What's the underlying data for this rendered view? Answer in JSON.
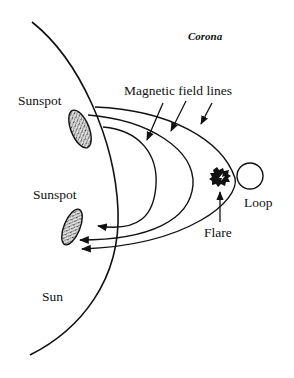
{
  "diagram": {
    "type": "solar-flare-schematic",
    "labels": {
      "corona": "Corona",
      "magnetic_field_lines": "Magnetic field lines",
      "sunspot_top": "Sunspot",
      "sunspot_bottom": "Sunspot",
      "loop": "Loop",
      "flare": "Flare",
      "sun": "Sun"
    },
    "colors": {
      "stroke": "#111111",
      "background": "#ffffff",
      "sunspot_fill": "#9a9a9a"
    }
  }
}
